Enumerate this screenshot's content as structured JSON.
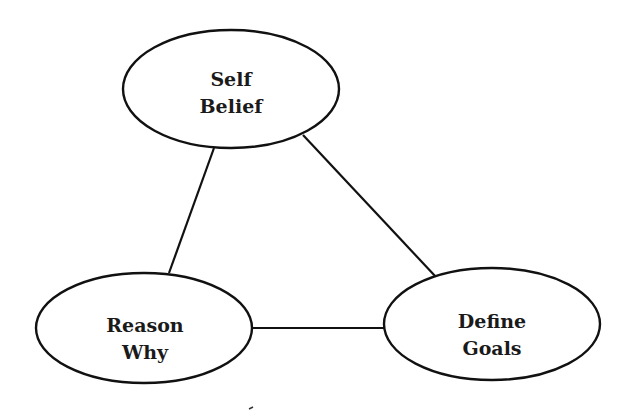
{
  "diagram": {
    "type": "triangle-relationship",
    "nodes": [
      {
        "id": "self-belief",
        "line1": "Self",
        "line2": "Belief",
        "cx": 231,
        "cy": 89,
        "rx": 108,
        "ry": 59
      },
      {
        "id": "reason-why",
        "line1": "Reason",
        "line2": "Why",
        "cx": 144,
        "cy": 328,
        "rx": 108,
        "ry": 55
      },
      {
        "id": "define-goals",
        "line1": "Define",
        "line2": "Goals",
        "cx": 492,
        "cy": 324,
        "rx": 108,
        "ry": 56
      }
    ],
    "edges": [
      {
        "from": "self-belief",
        "to": "reason-why"
      },
      {
        "from": "self-belief",
        "to": "define-goals"
      },
      {
        "from": "reason-why",
        "to": "define-goals"
      }
    ],
    "colors": {
      "stroke": "#111111",
      "text": "#1a1a1a",
      "background": "#ffffff"
    }
  }
}
